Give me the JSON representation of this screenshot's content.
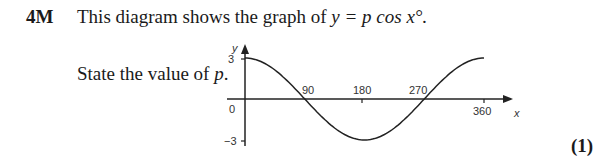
{
  "question": {
    "number": "4M",
    "text_prefix": "This diagram shows the graph of ",
    "equation": "y = p cos x°.",
    "prompt_prefix": "State the value of ",
    "prompt_var": "p",
    "prompt_suffix": ".",
    "marks": "(1)"
  },
  "chart_data": {
    "type": "line",
    "title": "y = p cos x°",
    "xlabel": "x",
    "ylabel": "y",
    "x_ticks": [
      90,
      180,
      270,
      360
    ],
    "y_ticks": [
      3,
      0,
      -3
    ],
    "xlim": [
      0,
      360
    ],
    "ylim": [
      -3,
      3
    ],
    "grid": false,
    "series": [
      {
        "name": "y = 3cos x",
        "x": [
          0,
          45,
          90,
          135,
          180,
          225,
          270,
          315,
          360
        ],
        "y": [
          3,
          2.12,
          0,
          -2.12,
          -3,
          -2.12,
          0,
          2.12,
          3
        ]
      }
    ]
  },
  "axis_labels": {
    "x": "x",
    "y": "y",
    "origin": "0",
    "y_top": "3",
    "y_bottom": "−3",
    "x90": "90",
    "x180": "180",
    "x270": "270",
    "x360": "360"
  }
}
